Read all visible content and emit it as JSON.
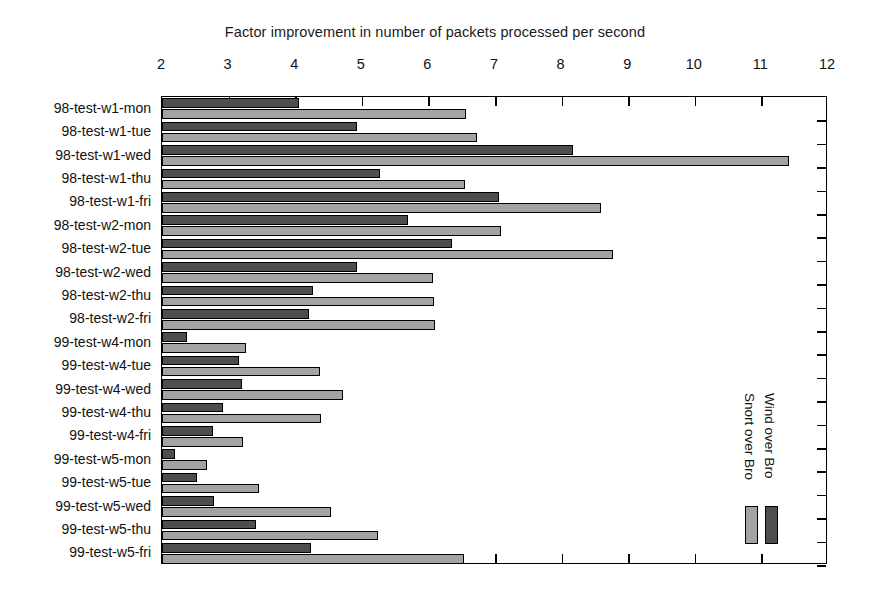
{
  "chart_data": {
    "type": "bar",
    "orientation": "horizontal",
    "title": "Factor improvement in number of packets processed per second",
    "xlabel": "",
    "ylabel": "",
    "xlim": [
      2,
      12
    ],
    "xticks": [
      2,
      3,
      4,
      5,
      6,
      7,
      8,
      9,
      10,
      11,
      12
    ],
    "grid": false,
    "legend_position": "inside-right",
    "categories": [
      "98-test-w1-mon",
      "98-test-w1-tue",
      "98-test-w1-wed",
      "98-test-w1-thu",
      "98-test-w1-fri",
      "98-test-w2-mon",
      "98-test-w2-tue",
      "98-test-w2-wed",
      "98-test-w2-thu",
      "98-test-w2-fri",
      "99-test-w4-mon",
      "99-test-w4-tue",
      "99-test-w4-wed",
      "99-test-w4-thu",
      "99-test-w4-fri",
      "99-test-w5-mon",
      "99-test-w5-tue",
      "99-test-w5-wed",
      "99-test-w5-thu",
      "99-test-w5-fri"
    ],
    "series": [
      {
        "name": "Wind over Bro",
        "color": "#4e4e4e",
        "values": [
          4.06,
          4.93,
          8.17,
          5.27,
          7.06,
          5.69,
          6.35,
          4.93,
          4.27,
          4.21,
          2.38,
          3.16,
          3.2,
          2.92,
          2.77,
          2.19,
          2.53,
          2.78,
          3.41,
          4.24
        ]
      },
      {
        "name": "Snort over Bro",
        "color": "#a3a3a3",
        "values": [
          6.56,
          6.73,
          11.42,
          6.55,
          8.59,
          7.09,
          8.77,
          6.07,
          6.08,
          6.1,
          3.26,
          4.37,
          4.72,
          4.39,
          3.22,
          2.67,
          3.45,
          4.54,
          5.24,
          6.53
        ]
      }
    ]
  },
  "legend": {
    "entries": [
      {
        "label": "Snort over Bro",
        "color": "#a3a3a3"
      },
      {
        "label": "Wind over Bro",
        "color": "#4e4e4e"
      }
    ]
  }
}
